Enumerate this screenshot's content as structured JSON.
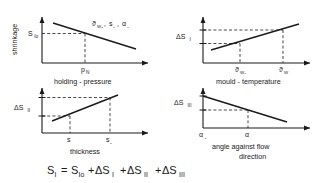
{
  "figure": {
    "type": "technical-diagram",
    "formula": {
      "lhs_base": "S",
      "lhs_sub": "I",
      "equals": "=",
      "terms": [
        {
          "base": "S",
          "sub": "Io",
          "op": ""
        },
        {
          "base": "ΔS",
          "sub": "I",
          "op": "+"
        },
        {
          "base": "ΔS",
          "sub": "II",
          "op": "+"
        },
        {
          "base": "ΔS",
          "sub": "III",
          "op": "+"
        }
      ],
      "plain": "S_I = S_Io + ΔS_I + ΔS_II + ΔS_III"
    }
  },
  "panels": {
    "top_left": {
      "name": "shrinkage-vs-holding-pressure",
      "y_axis_label": "shrinkage",
      "x_axis_label": "holding - pressure",
      "y_tick": {
        "base": "S",
        "sub": "Io"
      },
      "x_tick": {
        "base": "p",
        "sub": "N"
      },
      "curve_label_parts": [
        {
          "base": "ϑ",
          "sub": "W₀"
        },
        {
          "base": "s",
          "sub": "₀"
        },
        {
          "base": "α",
          "sub": "₀"
        }
      ],
      "curve_label_plain": "ϑW₀ , s₀ , α₀",
      "trend": "decreasing"
    },
    "top_right": {
      "name": "delta-s-one-vs-mould-temperature",
      "y_axis_label_base": "ΔS",
      "y_axis_label_sub": "I",
      "x_axis_label": "mould - temperature",
      "x_tick_1": {
        "base": "ϑ",
        "sub": "W₀"
      },
      "x_tick_2": {
        "base": "ϑ",
        "sub": "W"
      },
      "trend": "increasing"
    },
    "bottom_left": {
      "name": "delta-s-two-vs-thickness",
      "y_axis_label_base": "ΔS",
      "y_axis_label_sub": "II",
      "x_axis_label": "thickness",
      "x_tick_1": {
        "base": "s",
        "sub": ""
      },
      "x_tick_2": {
        "base": "s",
        "sub": "₀"
      },
      "trend": "increasing"
    },
    "bottom_right": {
      "name": "delta-s-three-vs-angle",
      "y_axis_label_base": "ΔS",
      "y_axis_label_sub": "III",
      "x_axis_label_line1": "angle against flow",
      "x_axis_label_line2": "direction",
      "x_tick_1": {
        "base": "α",
        "sub": "₀"
      },
      "x_tick_2": {
        "base": "α",
        "sub": ""
      },
      "trend": "decreasing"
    }
  },
  "style": {
    "ink": "#1a1a1a",
    "background": "#ffffff"
  }
}
